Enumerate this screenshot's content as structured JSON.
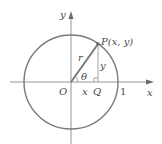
{
  "diagram": {
    "type": "unit-circle-trig-definition",
    "colors": {
      "background": "#ffffff",
      "axis": "#8a8a8a",
      "circle": "#7a7a7a",
      "radius_segment": "#7a7a7a",
      "vertical_leg": "#9a9a9a",
      "text": "#4a4a4a",
      "point": "#6a6a6a"
    },
    "labels": {
      "x_axis": "x",
      "y_axis": "y",
      "origin": "O",
      "point": "P(x, y)",
      "foot": "Q",
      "radius": "r",
      "angle": "θ",
      "horizontal_leg": "x",
      "vertical_leg": "y",
      "unit_mark": "1"
    }
  }
}
